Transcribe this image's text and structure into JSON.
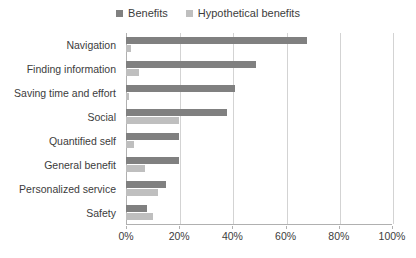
{
  "chart_data": {
    "type": "bar",
    "orientation": "horizontal",
    "title": "",
    "subtitle": "",
    "xlabel": "",
    "ylabel": "",
    "xlim": [
      0,
      100
    ],
    "xticks": [
      0,
      20,
      40,
      60,
      80,
      100
    ],
    "xtick_labels": [
      "0%",
      "20%",
      "40%",
      "60%",
      "80%",
      "100%"
    ],
    "grid": "vertical",
    "legend_position": "top-center",
    "categories": [
      "Navigation",
      "Finding information",
      "Saving time and effort",
      "Social",
      "Quantified self",
      "General benefit",
      "Personalized service",
      "Safety"
    ],
    "series": [
      {
        "name": "Benefits",
        "color": "#808080",
        "values": [
          68,
          49,
          41,
          38,
          20,
          20,
          15,
          8
        ]
      },
      {
        "name": "Hypothetical benefits",
        "color": "#bfbfbf",
        "values": [
          2,
          5,
          1,
          20,
          3,
          7,
          12,
          10
        ]
      }
    ]
  },
  "legend": {
    "entries": [
      {
        "label": "Benefits",
        "color": "#808080",
        "swatch_icon": "square-swatch-icon"
      },
      {
        "label": "Hypothetical benefits",
        "color": "#bfbfbf",
        "swatch_icon": "square-swatch-icon"
      }
    ]
  },
  "colors": {
    "axis": "#b0b0b0",
    "gridline": "#d3d3d3",
    "text": "#3c3c3c",
    "background": "#ffffff"
  }
}
